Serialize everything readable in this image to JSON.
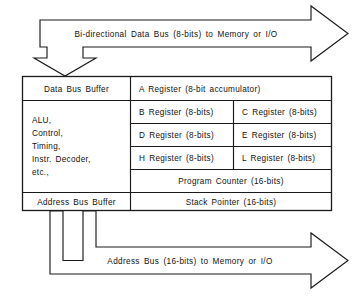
{
  "diagram": {
    "top_bus": {
      "label": "Bi-directional  Data  Bus  (8-bits)  to  Memory  or  I/O",
      "direction": "bidirectional",
      "width_bits": 8
    },
    "bottom_bus": {
      "label": "Address  Bus  (16-bits)  to  Memory  or  I/O",
      "direction": "outbound",
      "width_bits": 16
    },
    "left_column": {
      "data_bus_buffer": "Data  Bus  Buffer",
      "alu_block_lines": [
        "ALU,",
        "Control,",
        "Timing,",
        "Instr.  Decoder,",
        "etc.,"
      ],
      "address_bus_buffer": "Address  Bus  Buffer"
    },
    "registers": {
      "accumulator": "A  Register  (8-bit  accumulator)",
      "pairs": [
        {
          "left": "B  Register  (8-bits)",
          "right": "C  Register  (8-bits)"
        },
        {
          "left": "D  Register  (8-bits)",
          "right": "E  Register  (8-bits)"
        },
        {
          "left": "H  Register  (8-bits)",
          "right": "L  Register  (8-bits)"
        }
      ],
      "program_counter": "Program  Counter  (16-bits)",
      "stack_pointer": "Stack  Pointer  (16-bits)"
    },
    "colors": {
      "ink": "#1a1a1a",
      "paper": "#ffffff"
    }
  }
}
